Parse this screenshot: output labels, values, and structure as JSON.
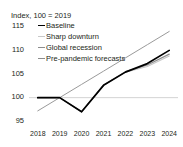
{
  "chart_data": {
    "type": "line",
    "title": "Index, 100 = 2019",
    "xlabel": "",
    "ylabel": "",
    "x": [
      2018,
      2019,
      2020,
      2021,
      2022,
      2023,
      2024
    ],
    "xtick_labels": [
      "2018",
      "2019",
      "2020",
      "2021",
      "2022",
      "2023",
      "2024"
    ],
    "ytick_labels": [
      "115",
      "110",
      "105",
      "100",
      "95"
    ],
    "ytick_values": [
      115,
      110,
      105,
      100,
      95
    ],
    "ylim": [
      94,
      116
    ],
    "xlim": [
      2017.6,
      2024.4
    ],
    "grid": "horizontal-at-100",
    "legend_position": "top-left-inside",
    "series": [
      {
        "name": "Baseline",
        "color": "#000000",
        "width": 1.7,
        "values": [
          100.0,
          100.0,
          97.0,
          102.6,
          105.4,
          107.2,
          110.0
        ]
      },
      {
        "name": "Sharp downturn",
        "color": "#c8c8c8",
        "width": 1.1,
        "values": [
          100.0,
          100.0,
          97.0,
          102.6,
          105.4,
          106.6,
          108.8
        ]
      },
      {
        "name": "Global recession",
        "color": "#8c8c8c",
        "width": 1.2,
        "values": [
          100.0,
          100.0,
          97.0,
          102.6,
          105.5,
          106.9,
          109.2
        ]
      },
      {
        "name": "Pre-pandemic forecasts",
        "color": "#9a9a9a",
        "width": 1.0,
        "values": [
          97.2,
          100.0,
          102.8,
          105.6,
          108.4,
          111.2,
          114.0
        ]
      }
    ]
  },
  "legend": {
    "items": [
      {
        "label": "Baseline",
        "color": "#000000"
      },
      {
        "label": "Sharp downturn",
        "color": "#c8c8c8"
      },
      {
        "label": "Global recession",
        "color": "#8c8c8c"
      },
      {
        "label": "Pre-pandemic forecasts",
        "color": "#8c8c8c"
      }
    ]
  }
}
